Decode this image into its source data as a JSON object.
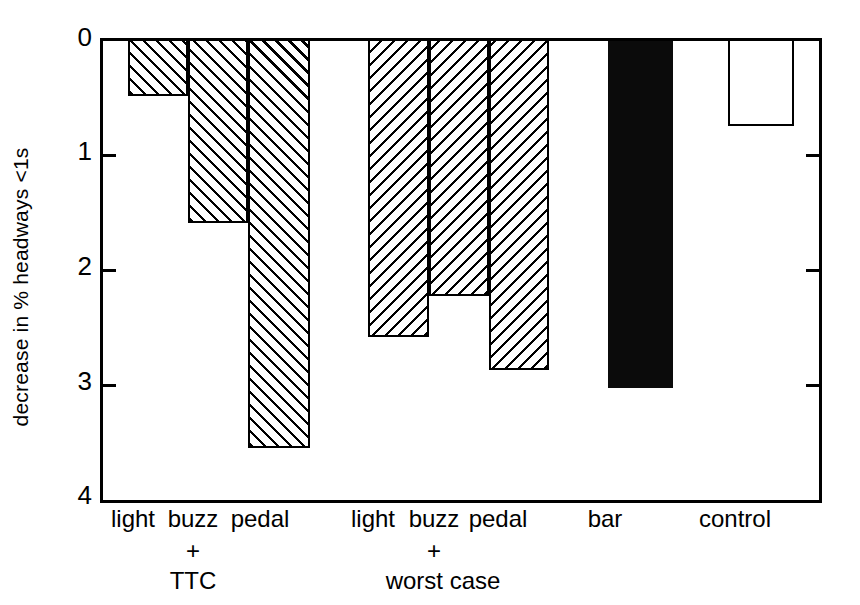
{
  "chart_data": {
    "type": "bar",
    "title": "",
    "subtitle": "",
    "xlabel": "",
    "ylabel": "decrease in % headways <1s",
    "ylim": [
      0,
      4
    ],
    "y_inverted": true,
    "yticks": [
      0,
      1,
      2,
      3,
      4
    ],
    "ytick_labels": [
      "0",
      "1",
      "2",
      "3",
      "4"
    ],
    "grid": false,
    "legend": null,
    "categories": [
      "light",
      "buzz\n+\nTTC",
      "pedal",
      "light",
      "buzz\n+\nworst case",
      "pedal",
      "bar",
      "control"
    ],
    "bar_labels": [
      "light",
      "buzz",
      "pedal",
      "light",
      "buzz",
      "pedal",
      "bar",
      "control"
    ],
    "group_labels": [
      "+\nTTC",
      "+\nworst case"
    ],
    "values": [
      0.48,
      1.59,
      3.55,
      2.58,
      2.22,
      2.87,
      3.02,
      0.74
    ],
    "bars": [
      {
        "label": "light",
        "group": "TTC",
        "value": 0.48,
        "fill": "hatch-forward"
      },
      {
        "label": "buzz",
        "group": "TTC",
        "value": 1.59,
        "fill": "hatch-forward"
      },
      {
        "label": "pedal",
        "group": "TTC",
        "value": 3.55,
        "fill": "hatch-forward"
      },
      {
        "label": "light",
        "group": "worst case",
        "value": 2.58,
        "fill": "hatch-backward"
      },
      {
        "label": "buzz",
        "group": "worst case",
        "value": 2.22,
        "fill": "hatch-backward"
      },
      {
        "label": "pedal",
        "group": "worst case",
        "value": 2.87,
        "fill": "hatch-backward"
      },
      {
        "label": "bar",
        "group": "",
        "value": 3.02,
        "fill": "solid-black"
      },
      {
        "label": "control",
        "group": "",
        "value": 0.74,
        "fill": "open-white"
      }
    ],
    "colors": {
      "axis": "#000000",
      "hatch": "#000000",
      "solid_bar": "#0b0b0b",
      "open_bar": "#ffffff",
      "background": "#ffffff"
    }
  },
  "axis": {
    "y_title": "decrease in % headways <1s",
    "y_tick_0": "0",
    "y_tick_1": "1",
    "y_tick_2": "2",
    "y_tick_3": "3",
    "y_tick_4": "4"
  },
  "xaxis": {
    "bar1": "light",
    "bar2": "buzz",
    "bar3": "pedal",
    "bar4": "light",
    "bar5": "buzz",
    "bar6": "pedal",
    "bar7": "bar",
    "bar8": "control",
    "group1_plus": "+",
    "group1_name": "TTC",
    "group2_plus": "+",
    "group2_name": "worst case"
  }
}
